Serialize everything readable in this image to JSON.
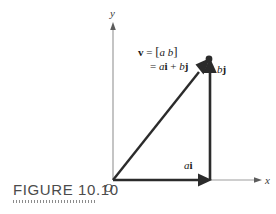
{
  "figure": {
    "caption": "FIGURE 10.10",
    "axes": {
      "x_label": "x",
      "y_label": "y",
      "origin_label": "O"
    },
    "labels": {
      "x_component": {
        "scalar": "a",
        "unit": "i"
      },
      "y_component": {
        "scalar": "b",
        "unit": "j"
      },
      "vector_line1": {
        "name": "v",
        "equals": "=",
        "bracket_open": "[",
        "comp_a": "a",
        "comp_b": "b",
        "bracket_close": "]"
      },
      "vector_line2": {
        "equals": "=",
        "term1_scalar": "a",
        "term1_unit": "i",
        "plus": "+",
        "term2_scalar": "b",
        "term2_unit": "j"
      }
    },
    "colors": {
      "vector_stroke": "#2b2b2b",
      "axis_stroke": "#9a9a9a",
      "caption_text": "#4b4b4b",
      "background": "#ffffff"
    },
    "geometry": {
      "origin": [
        113,
        180
      ],
      "tip": [
        210,
        62
      ],
      "x_axis_end": [
        262,
        180
      ],
      "y_axis_top": [
        113,
        24
      ]
    }
  }
}
